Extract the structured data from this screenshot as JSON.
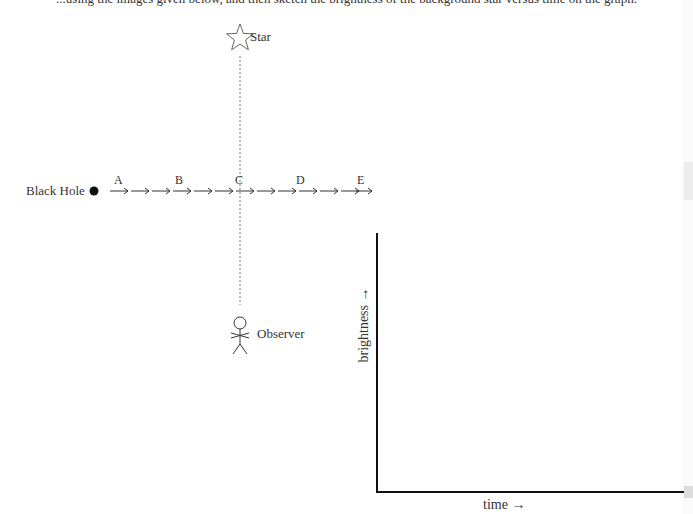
{
  "top_cut_text": "...using the images given below, and then sketch the brightness of the background star versus time on the graph.",
  "diagram": {
    "star_label": "Star",
    "black_hole_label": "Black Hole",
    "observer_label": "Observer",
    "path_labels": [
      "A",
      "B",
      "C",
      "D",
      "E"
    ]
  },
  "graph": {
    "y_axis_label": "brightness →",
    "x_axis_label": "time →"
  }
}
